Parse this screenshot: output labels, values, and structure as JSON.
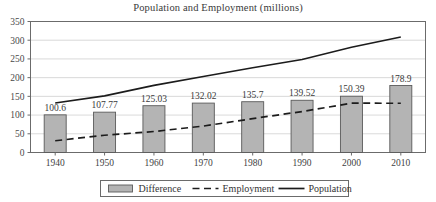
{
  "chart_data": {
    "type": "bar",
    "title": "Population and Employment (millions)",
    "xlabel": "",
    "ylabel": "",
    "ylim": [
      0,
      350
    ],
    "yticks": [
      0,
      50,
      100,
      150,
      200,
      250,
      300,
      350
    ],
    "categories": [
      "1940",
      "1950",
      "1960",
      "1970",
      "1980",
      "1990",
      "2000",
      "2010"
    ],
    "grid": true,
    "legend_position": "bottom",
    "series": [
      {
        "name": "Difference",
        "kind": "bar",
        "color": "#b4b4b4",
        "edge_color": "#5a5a5a",
        "values": [
          100.6,
          107.77,
          125.03,
          132.02,
          135.7,
          139.52,
          150.39,
          178.9
        ],
        "data_labels": [
          "100.6",
          "107.77",
          "125.03",
          "132.02",
          "135.7",
          "139.52",
          "150.39",
          "178.9"
        ]
      },
      {
        "name": "Employment",
        "kind": "line",
        "style": "dashed",
        "color": "#1c1c1c",
        "values": [
          31.4,
          46.1,
          56.1,
          70.6,
          90.5,
          109.5,
          131.7,
          131.6
        ]
      },
      {
        "name": "Population",
        "kind": "line",
        "style": "solid",
        "color": "#1c1c1c",
        "values": [
          132.1,
          151.3,
          179.3,
          203.2,
          226.5,
          248.7,
          281.4,
          308.7
        ]
      }
    ]
  },
  "legend": {
    "items": [
      {
        "label": "Difference",
        "marker": "filled-rect-swatch"
      },
      {
        "label": "Employment",
        "marker": "dashed-line-swatch"
      },
      {
        "label": "Population",
        "marker": "solid-line-swatch"
      }
    ]
  },
  "colors": {
    "bar_fill": "#b4b4b4",
    "bar_edge": "#5a5a5a",
    "line": "#1c1c1c",
    "gridline": "#cfcfcf",
    "axis": "#6b6b6b",
    "background": "#ffffff"
  }
}
